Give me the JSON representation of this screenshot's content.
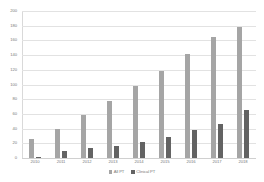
{
  "chart_data": {
    "type": "bar",
    "title": "",
    "subtitle": "",
    "xlabel": "",
    "ylabel": "",
    "categories": [
      "2010",
      "2011",
      "2012",
      "2013",
      "2014",
      "2015",
      "2016",
      "2017",
      "2018"
    ],
    "series": [
      {
        "name": "All PT",
        "color": "#a5a5a5",
        "values": [
          26,
          40,
          58,
          77,
          98,
          118,
          141,
          164,
          178
        ]
      },
      {
        "name": "Clinical PT",
        "color": "#636363",
        "values": [
          2,
          9,
          13,
          17,
          22,
          28,
          38,
          46,
          65
        ]
      }
    ],
    "ylim": [
      0,
      200
    ],
    "ytick_step": 20,
    "yticks": [
      "0",
      "20",
      "40",
      "60",
      "80",
      "100",
      "120",
      "140",
      "160",
      "180",
      "200"
    ],
    "grid": true,
    "legend_position": "bottom"
  }
}
